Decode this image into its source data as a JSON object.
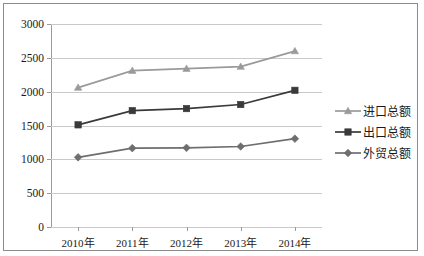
{
  "chart_data": {
    "type": "line",
    "title": "",
    "xlabel": "",
    "ylabel": "",
    "categories": [
      "2010年",
      "2011年",
      "2012年",
      "2013年",
      "2014年"
    ],
    "ylim": [
      0,
      3000
    ],
    "yticks": [
      0,
      500,
      1000,
      1500,
      2000,
      2500,
      3000
    ],
    "ytick_labels": [
      "0",
      "500",
      "1000",
      "1500",
      "2000",
      "2500",
      "3000"
    ],
    "grid": true,
    "legend_position": "right",
    "series": [
      {
        "name": "进口总额",
        "marker": "triangle",
        "color": "#9a9a9a",
        "values": [
          2060,
          2310,
          2340,
          2370,
          2600
        ]
      },
      {
        "name": "出口总额",
        "marker": "square",
        "color": "#3a3a3a",
        "values": [
          1510,
          1720,
          1750,
          1810,
          2020
        ]
      },
      {
        "name": "外贸总额",
        "marker": "diamond",
        "color": "#6e6e6e",
        "values": [
          1030,
          1165,
          1170,
          1190,
          1305
        ]
      }
    ]
  },
  "colors": {
    "import_series": "#9a9a9a",
    "export_series": "#3a3a3a",
    "trade_series": "#6e6e6e",
    "gridline": "#c9c9c9",
    "axis": "#9a9a9a",
    "border": "#8c8c8c",
    "text": "#1a1a1a"
  }
}
